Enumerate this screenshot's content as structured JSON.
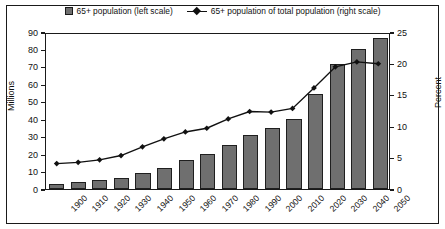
{
  "chart_data": {
    "type": "bar",
    "title": "",
    "subtitle": "",
    "xlabel": "",
    "ylabel": "Millions",
    "y2label": "Percent",
    "ylim": [
      0,
      90
    ],
    "y2lim": [
      0,
      25
    ],
    "yticks": [
      0,
      10,
      20,
      30,
      40,
      50,
      60,
      70,
      80,
      90
    ],
    "y2ticks": [
      0,
      5,
      10,
      15,
      20,
      25
    ],
    "grid": false,
    "legend_position": "top-center",
    "categories": [
      "1900",
      "1910",
      "1920",
      "1930",
      "1940",
      "1950",
      "1960",
      "1970",
      "1980",
      "1990",
      "2000",
      "2010",
      "2020",
      "2030",
      "2040",
      "2050"
    ],
    "series": [
      {
        "name": "65+ population (left scale)",
        "type": "bar",
        "axis": "left",
        "unit": "Millions",
        "color": "#6f6f6f",
        "edge_color": "#1f1f1f",
        "values": [
          3.1,
          4.0,
          4.9,
          6.6,
          9.0,
          12.3,
          16.6,
          20.1,
          25.5,
          31.2,
          35.0,
          40.2,
          54.6,
          71.5,
          80.0,
          86.7
        ]
      },
      {
        "name": "65+ population of total population (right scale)",
        "type": "line",
        "axis": "right",
        "unit": "Percent",
        "color": "#111111",
        "marker": "diamond",
        "values": [
          4.1,
          4.3,
          4.7,
          5.4,
          6.8,
          8.1,
          9.2,
          9.8,
          11.3,
          12.5,
          12.4,
          13.0,
          16.3,
          19.7,
          20.5,
          20.2
        ]
      }
    ]
  },
  "legend": {
    "entries": [
      {
        "label": "65+ population (left scale)",
        "marker": "square-swatch"
      },
      {
        "label": "65+ population of total population (right scale)",
        "marker": "line-diamond"
      }
    ]
  },
  "axes": {
    "left_title": "Millions",
    "right_title": "Percent"
  }
}
